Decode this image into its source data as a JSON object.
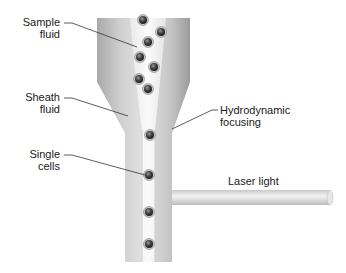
{
  "labels": {
    "sample_fluid": {
      "line1": "Sample",
      "line2": "fluid"
    },
    "sheath_fluid": {
      "line1": "Sheath",
      "line2": "fluid"
    },
    "single_cells": {
      "line1": "Single",
      "line2": "cells"
    },
    "hydrodynamic_focusing": {
      "line1": "Hydrodynamic",
      "line2": "focusing"
    },
    "laser_light": "Laser light"
  },
  "colors": {
    "tube_dark": "#9a9a9a",
    "tube_light": "#e6e6e6",
    "sample_stream": "#f4f4f4",
    "cell_fill": "#4a4a4a",
    "cell_ring": "#bdbdbd",
    "leader_line": "#333333",
    "text": "#1a1a1a"
  },
  "cells_wide_section": [
    {
      "x": 143,
      "y": 20
    },
    {
      "x": 161,
      "y": 32
    },
    {
      "x": 148,
      "y": 42
    },
    {
      "x": 140,
      "y": 57
    },
    {
      "x": 154,
      "y": 67
    },
    {
      "x": 139,
      "y": 79
    },
    {
      "x": 148,
      "y": 89
    }
  ],
  "cells_narrow_section": [
    {
      "x": 150,
      "y": 135
    },
    {
      "x": 149,
      "y": 175
    },
    {
      "x": 149,
      "y": 212
    },
    {
      "x": 149,
      "y": 244
    }
  ]
}
